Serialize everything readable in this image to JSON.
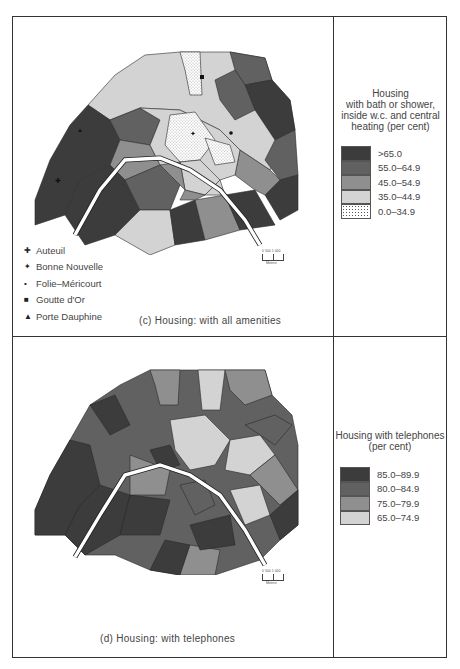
{
  "colors": {
    "class1": "#3c3c3c",
    "class2": "#616161",
    "class3": "#8f8f8f",
    "class4": "#d3d3d3",
    "class5": "#ffffff",
    "border": "#333333",
    "river": "#ffffff"
  },
  "panel_c": {
    "caption": "(c) Housing: with all amenities",
    "legend_title_lines": [
      "Housing",
      "with bath or shower,",
      "inside w.c. and central",
      "heating (per cent)"
    ],
    "legend": [
      {
        "label": ">65.0",
        "color": "#3c3c3c"
      },
      {
        "label": "55.0–64.9",
        "color": "#616161"
      },
      {
        "label": "45.0–54.9",
        "color": "#8f8f8f"
      },
      {
        "label": "35.0–44.9",
        "color": "#d3d3d3"
      },
      {
        "label": "0.0–34.9",
        "color": "stippled"
      }
    ],
    "places": [
      {
        "symbol": "✚",
        "name": "Auteuil"
      },
      {
        "symbol": "✦",
        "name": "Bonne Nouvelle"
      },
      {
        "symbol": "•",
        "name": "Folie–Méricourt"
      },
      {
        "symbol": "■",
        "name": "Goutte d'Or"
      },
      {
        "symbol": "▲",
        "name": "Porte Dauphine"
      }
    ],
    "scale": {
      "ticks": "0   500  1 000",
      "unit": "Metres"
    }
  },
  "panel_d": {
    "caption": "(d) Housing: with telephones",
    "legend_title_lines": [
      "Housing with telephones",
      "(per cent)"
    ],
    "legend": [
      {
        "label": "85.0–89.9",
        "color": "#3c3c3c"
      },
      {
        "label": "80.0–84.9",
        "color": "#616161"
      },
      {
        "label": "75.0–79.9",
        "color": "#8f8f8f"
      },
      {
        "label": "65.0–74.9",
        "color": "#d3d3d3"
      }
    ],
    "scale": {
      "ticks": "0   500  1 000",
      "unit": "Metres"
    }
  }
}
